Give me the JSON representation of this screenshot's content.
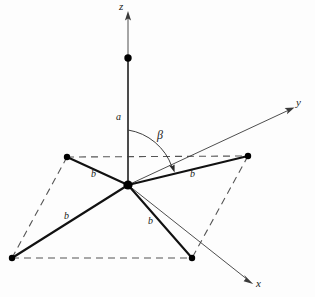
{
  "figure": {
    "background_color": "#fdfdfd",
    "line_color": "#111111",
    "axis_color": "#3a3a3a",
    "dash_color": "#555555"
  },
  "axes": [
    {
      "name": "z",
      "label": "z",
      "label_x": 119,
      "label_y": 2,
      "origin": [
        128,
        185
      ],
      "tip": [
        128,
        13
      ]
    },
    {
      "name": "y",
      "label": "y",
      "label_x": 296,
      "label_y": 98,
      "origin": [
        128,
        185
      ],
      "tip": [
        294,
        107
      ]
    },
    {
      "name": "x",
      "label": "x",
      "label_x": 256,
      "label_y": 279,
      "origin": [
        128,
        185
      ],
      "tip": [
        253,
        284
      ]
    }
  ],
  "labels": {
    "axis_z": "z",
    "axis_y": "y",
    "axis_x": "x",
    "bond_a": "a",
    "angle_beta": "β",
    "bond_b": "b"
  },
  "bond_labels": [
    {
      "id": "a-label",
      "text": "a",
      "x": 116,
      "y": 113
    },
    {
      "id": "b-left",
      "text": "b",
      "x": 91,
      "y": 170
    },
    {
      "id": "b-right",
      "text": "b",
      "x": 190,
      "y": 170
    },
    {
      "id": "b-lower-left",
      "text": "b",
      "x": 64,
      "y": 212
    },
    {
      "id": "b-lower-right",
      "text": "b",
      "x": 148,
      "y": 217
    }
  ],
  "angle_label": {
    "id": "beta-label",
    "text": "β",
    "x": 157,
    "y": 130
  },
  "atoms": [
    {
      "id": "center",
      "cx": 128,
      "cy": 185,
      "r": 4.4,
      "role": "central-atom"
    },
    {
      "id": "apex",
      "cx": 128,
      "cy": 58,
      "r": 3.6,
      "role": "axial-atom"
    },
    {
      "id": "upper-left",
      "cx": 67,
      "cy": 157,
      "r": 3.1,
      "role": "ligand-atom"
    },
    {
      "id": "upper-right",
      "cx": 248,
      "cy": 156,
      "r": 3.1,
      "role": "ligand-atom"
    },
    {
      "id": "lower-left",
      "cx": 12,
      "cy": 258,
      "r": 3.1,
      "role": "ligand-atom"
    },
    {
      "id": "lower-right",
      "cx": 192,
      "cy": 258,
      "r": 3.1,
      "role": "ligand-atom"
    }
  ],
  "bonds": [
    {
      "id": "bond-a-axial",
      "x1": 128,
      "y1": 58,
      "x2": 128,
      "y2": 185,
      "length_label": "a"
    },
    {
      "id": "bond-b-up-left",
      "x1": 128,
      "y1": 185,
      "x2": 67,
      "y2": 157,
      "length_label": "b"
    },
    {
      "id": "bond-b-up-right",
      "x1": 128,
      "y1": 185,
      "x2": 248,
      "y2": 156,
      "length_label": "b"
    },
    {
      "id": "bond-b-low-left",
      "x1": 128,
      "y1": 185,
      "x2": 12,
      "y2": 258,
      "length_label": "b"
    },
    {
      "id": "bond-b-low-right",
      "x1": 128,
      "y1": 185,
      "x2": 192,
      "y2": 258,
      "length_label": "b"
    }
  ],
  "dashed_edges": [
    {
      "id": "dash-top",
      "x1": 67,
      "y1": 157,
      "x2": 248,
      "y2": 156
    },
    {
      "id": "dash-bottom",
      "x1": 12,
      "y1": 258,
      "x2": 192,
      "y2": 258
    },
    {
      "id": "dash-left",
      "x1": 67,
      "y1": 157,
      "x2": 12,
      "y2": 258
    },
    {
      "id": "dash-right",
      "x1": 248,
      "y1": 156,
      "x2": 192,
      "y2": 258
    }
  ]
}
